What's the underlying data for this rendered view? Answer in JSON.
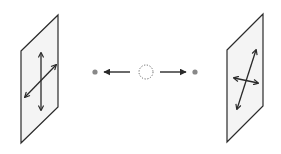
{
  "diagram": {
    "colors": {
      "stroke": "#2a2a2a",
      "panel_fill": "#f4f4f4",
      "dot": "#888888",
      "source_circle": "#666666",
      "background": "#ffffff"
    },
    "left_panel": {
      "label": "",
      "arrows": [
        "vertical-double-arrow",
        "diagonal-double-arrow"
      ]
    },
    "right_panel": {
      "label": "",
      "arrows": [
        "diagonal-double-arrow",
        "horizontal-double-arrow"
      ]
    },
    "center": {
      "source": "dotted-circle",
      "left_particle": "dot",
      "right_particle": "dot",
      "arrows": [
        "left-arrow",
        "right-arrow"
      ]
    }
  }
}
